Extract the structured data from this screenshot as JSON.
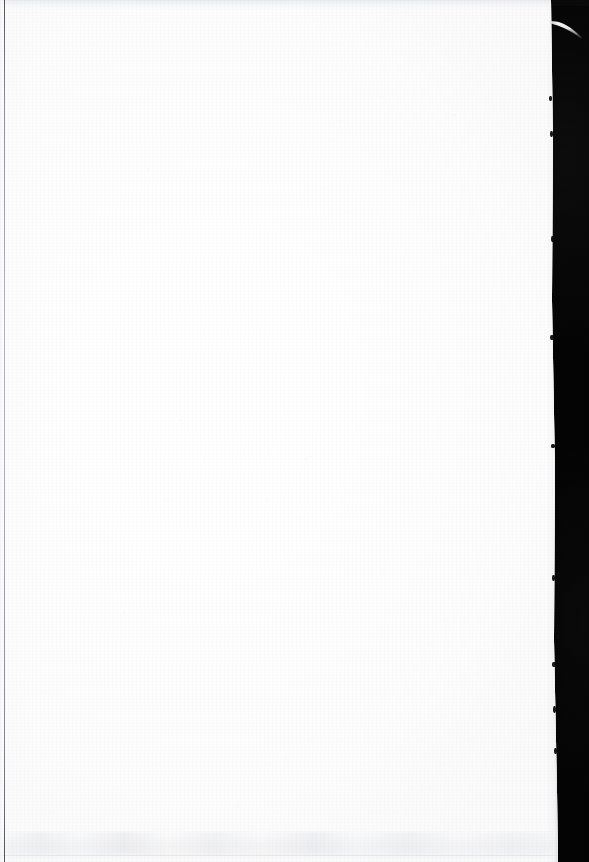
{
  "document": {
    "kind": "scanned-page-image",
    "page_content_text": "",
    "page_description": "Blank scanned book page (no printed text, no figures, no page number)",
    "orientation": "portrait"
  },
  "canvas": {
    "width_px": 589,
    "height_px": 862,
    "background_color": "#040404"
  },
  "page": {
    "paper_color": "#ffffff",
    "paper_tint_color": "#fdfdfe",
    "left_px": 0,
    "top_px": 0,
    "width_px": 560,
    "height_px": 862,
    "right_edge_top_x_px": 551,
    "right_edge_bottom_x_px": 558
  },
  "artifacts": {
    "left_edge_rule": {
      "label": "dark vertical gutter line",
      "x_px": 4,
      "thickness_px": 1.4,
      "color": "#4a4c52"
    },
    "top_shadow_band": {
      "label": "light gray band along top edge",
      "height_px": 10,
      "color": "#e8eaee"
    },
    "bottom_shadow_band": {
      "label": "mottled gray band near bottom edge",
      "top_px": 832,
      "height_px": 22,
      "color": "#e6e7ea"
    },
    "fiber_wisp": {
      "label": "pale thread or hair extending into the black field",
      "start_x_px": 551,
      "start_y_px": 22,
      "end_x_px": 581,
      "end_y_px": 39,
      "color": "#f2f3f5"
    },
    "edge_nicks": {
      "label": "small dark notches along the torn right paper edge",
      "count": 9
    }
  },
  "colors": {
    "scanner_background": "#040404",
    "paper": "#ffffff",
    "paper_shadow": "#e6e7ea",
    "edge_line": "#4a4c52",
    "fiber": "#f2f3f5"
  }
}
